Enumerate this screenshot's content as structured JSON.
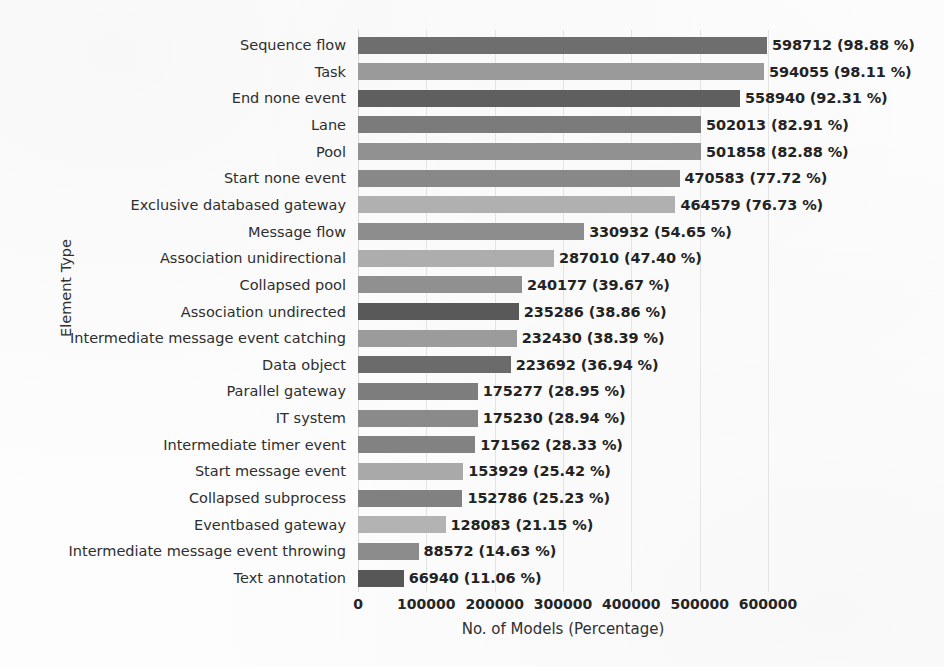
{
  "chart_data": {
    "type": "bar",
    "orientation": "horizontal",
    "title": "",
    "xlabel": "No. of Models (Percentage)",
    "ylabel": "Element Type",
    "xlim": [
      0,
      650000
    ],
    "xticks": [
      0,
      100000,
      200000,
      300000,
      400000,
      500000,
      600000
    ],
    "xticklabels": [
      "0",
      "100000",
      "200000",
      "300000",
      "400000",
      "500000",
      "600000"
    ],
    "grid": true,
    "legend": "none",
    "categories": [
      "Sequence flow",
      "Task",
      "End none event",
      "Lane",
      "Pool",
      "Start none event",
      "Exclusive  databased  gateway",
      "Message flow",
      "Association  unidirectional",
      "Collapsed pool",
      "Association  undirected",
      "Intermediate message event catching",
      "Data object",
      "Parallel gateway",
      "IT system",
      "Intermediate timer event",
      "Start message event",
      "Collapsed subprocess",
      "Eventbased gateway",
      "Intermediate message event throwing",
      "Text annotation"
    ],
    "values": [
      598712,
      594055,
      558940,
      502013,
      501858,
      470583,
      464579,
      330932,
      287010,
      240177,
      235286,
      232430,
      223692,
      175277,
      175230,
      171562,
      153929,
      152786,
      128083,
      88572,
      66940
    ],
    "percentages": [
      "98.88 %",
      "98.11 %",
      "92.31 %",
      "82.91 %",
      "82.88 %",
      "77.72 %",
      "76.73 %",
      "54.65 %",
      "47.40 %",
      "39.67 %",
      "38.86 %",
      "38.39 %",
      "36.94 %",
      "28.95 %",
      "28.94 %",
      "28.33 %",
      "25.42 %",
      "25.23 %",
      "21.15 %",
      "14.63 %",
      "11.06 %"
    ],
    "data_labels": [
      "598712 (98.88 %)",
      "594055 (98.11 %)",
      "558940 (92.31 %)",
      "502013 (82.91 %)",
      "501858 (82.88 %)",
      "470583 (77.72 %)",
      "464579 (76.73 %)",
      "330932 (54.65 %)",
      "287010 (47.40 %)",
      "240177 (39.67 %)",
      "235286 (38.86 %)",
      "232430 (38.39 %)",
      "223692 (36.94 %)",
      "175277 (28.95 %)",
      "175230 (28.94 %)",
      "171562 (28.33 %)",
      "153929 (25.42 %)",
      "152786 (25.23 %)",
      "128083 (21.15 %)",
      "88572 (14.63 %)",
      "66940 (11.06 %)"
    ],
    "bar_colors": [
      "#6e6e6e",
      "#9a9a9a",
      "#5f5f5f",
      "#7b7b7b",
      "#919191",
      "#888888",
      "#b0b0b0",
      "#8d8d8d",
      "#adadad",
      "#909090",
      "#595959",
      "#9b9b9b",
      "#6b6b6b",
      "#7d7d7d",
      "#8a8a8a",
      "#828282",
      "#a9a9a9",
      "#818181",
      "#b3b3b3",
      "#8c8c8c",
      "#575757"
    ]
  },
  "colors": {
    "background": "#fdfdfd",
    "grid": "#e4e4e4",
    "text": "#2b2b2b",
    "label_text": "#232323"
  }
}
